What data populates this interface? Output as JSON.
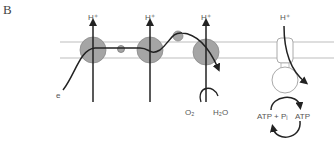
{
  "panel_label": "B",
  "labels": {
    "h_plus_1": "H⁺",
    "h_plus_2": "H⁺",
    "h_plus_3": "H⁺",
    "h_plus_4": "H⁺",
    "electron": "e",
    "oxygen": "O₂",
    "water": "H₂O",
    "atp_adp": "ATP + Pᵢ",
    "atp": "ATP"
  },
  "colors": {
    "membrane": "#bdbdbd",
    "complex_fill": "#a5a5a5",
    "complex_stroke": "#8a8a8a",
    "arrow": "#222222",
    "text": "#555555"
  }
}
